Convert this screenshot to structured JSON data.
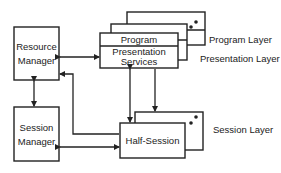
{
  "diagram": {
    "nodes": {
      "resource_manager": {
        "line1": "Resource",
        "line2": "Manager"
      },
      "session_manager": {
        "line1": "Session",
        "line2": "Manager"
      },
      "program": {
        "label": "Program"
      },
      "presentation_services": {
        "line1": "Presentation",
        "line2": "Services"
      },
      "half_session": {
        "label": "Half-Session"
      }
    },
    "layer_labels": {
      "program_layer": "Program Layer",
      "presentation_layer": "Presentation Layer",
      "session_layer": "Session Layer"
    },
    "edges": [
      {
        "from": "resource_manager",
        "to": "presentation_services",
        "direction": "bidirectional"
      },
      {
        "from": "resource_manager",
        "to": "session_manager",
        "direction": "bidirectional"
      },
      {
        "from": "half_session",
        "to": "resource_manager",
        "direction": "one-way"
      },
      {
        "from": "session_manager",
        "to": "half_session",
        "direction": "bidirectional"
      },
      {
        "from": "presentation_services",
        "to": "half_session",
        "direction": "bidirectional"
      },
      {
        "from": "presentation_services",
        "to": "half_session_back",
        "direction": "one-way"
      }
    ],
    "colors": {
      "stroke": "#222222",
      "background": "#ffffff"
    }
  }
}
